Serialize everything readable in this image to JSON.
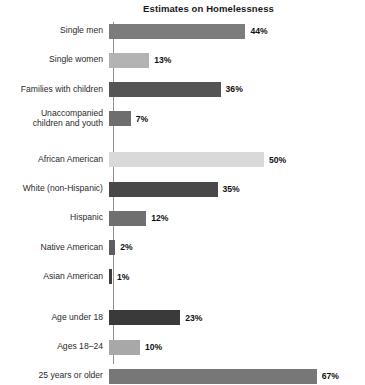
{
  "chart_data": {
    "type": "bar",
    "orientation": "horizontal",
    "title": "Estimates on Homelessness",
    "xlabel": "",
    "ylabel": "",
    "xlim": [
      0,
      70
    ],
    "grid": false,
    "legend": "none",
    "value_suffix": "%",
    "categories": [
      "Single men",
      "Single women",
      "Families with children",
      "Unaccompanied\nchildren and youth",
      "African American",
      "White (non-Hispanic)",
      "Hispanic",
      "Native American",
      "Asian American",
      "Age under 18",
      "Ages 18–24",
      "25 years or older"
    ],
    "values": [
      44,
      13,
      36,
      7,
      50,
      35,
      12,
      2,
      1,
      23,
      10,
      67
    ],
    "value_labels": [
      "44%",
      "13%",
      "36%",
      "7%",
      "50%",
      "35%",
      "12%",
      "2%",
      "1%",
      "23%",
      "10%",
      "67%"
    ],
    "bar_colors": [
      "#7c7c7c",
      "#b3b3b3",
      "#555555",
      "#6e6e6e",
      "#d9d9d9",
      "#484848",
      "#6f6f6f",
      "#5e5e5e",
      "#3d3d3d",
      "#3a3a3a",
      "#a8a8a8",
      "#777777"
    ],
    "groups": [
      {
        "name": "household-type",
        "indices": [
          0,
          1,
          2,
          3
        ]
      },
      {
        "name": "race-ethnicity",
        "indices": [
          4,
          5,
          6,
          7,
          8
        ]
      },
      {
        "name": "age",
        "indices": [
          9,
          10,
          11
        ]
      }
    ],
    "axis_color": "#909090",
    "background": "#ffffff",
    "px_per_unit": 3.1
  }
}
